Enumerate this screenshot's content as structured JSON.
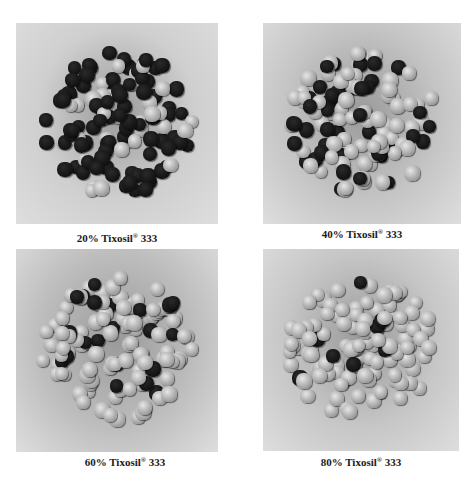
{
  "figure": {
    "panels": [
      {
        "id": "p20",
        "caption_pct": "20%",
        "caption_name": "Tixosil",
        "caption_mark": "®",
        "caption_grade": "333",
        "bg": "#cfcfcf",
        "dark_ratio": 0.72,
        "seed": 11
      },
      {
        "id": "p40",
        "caption_pct": "40%",
        "caption_name": "Tixosil",
        "caption_mark": "®",
        "caption_grade": "333",
        "bg": "#c4c4c4",
        "dark_ratio": 0.35,
        "seed": 23
      },
      {
        "id": "p60",
        "caption_pct": "60%",
        "caption_name": "Tixosil",
        "caption_mark": "®",
        "caption_grade": "333",
        "bg": "#bdbdbd",
        "dark_ratio": 0.18,
        "seed": 37
      },
      {
        "id": "p80",
        "caption_pct": "80%",
        "caption_name": "Tixosil",
        "caption_mark": "®",
        "caption_grade": "333",
        "bg": "#c6c6c6",
        "dark_ratio": 0.1,
        "seed": 53
      }
    ]
  }
}
